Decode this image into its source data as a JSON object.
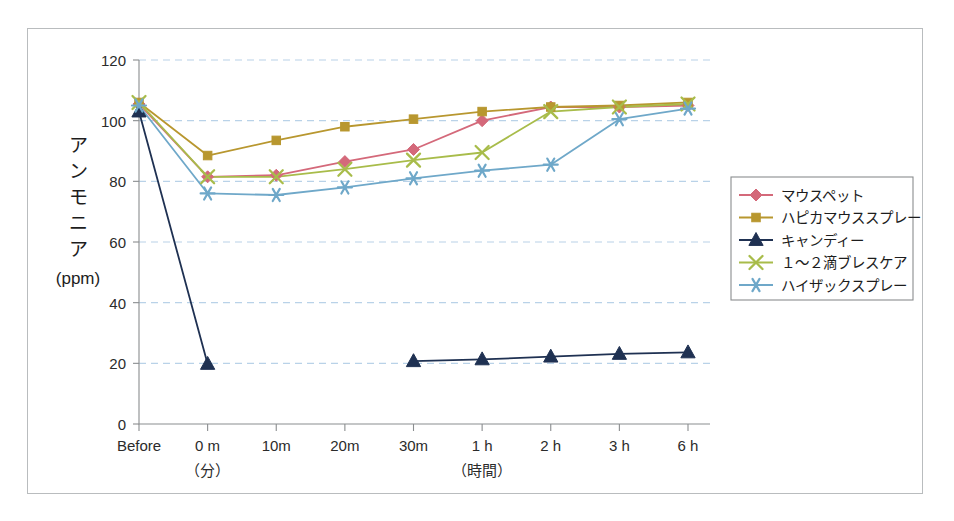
{
  "chart_data": {
    "type": "line",
    "title": "",
    "xlabel": "",
    "ylabel": "アンモニア（ppm）",
    "ylabel_vertical_chars": [
      "ア",
      "ン",
      "モ",
      "ニ",
      "ア"
    ],
    "ylabel_unit": "(ppm)",
    "categories": [
      "Before",
      "0 m",
      "10m",
      "20m",
      "30m",
      "1 h",
      "2 h",
      "3 h",
      "6 h"
    ],
    "x_group_labels": [
      {
        "text": "（分）",
        "after_category": "0 m"
      },
      {
        "text": "（時間）",
        "after_category": "1 h"
      }
    ],
    "ylim": [
      0,
      120
    ],
    "yticks": [
      0,
      20,
      40,
      60,
      80,
      100,
      120
    ],
    "grid": true,
    "grid_axis": "y",
    "legend_position": "right",
    "series": [
      {
        "name": "マウスペット",
        "color": "#d4697a",
        "marker": "diamond",
        "values": [
          105.5,
          81.5,
          82.0,
          86.5,
          90.5,
          100.0,
          104.5,
          104.5,
          105.0
        ]
      },
      {
        "name": "ハピカマウススプレー",
        "color": "#b8972f",
        "marker": "square",
        "values": [
          106.0,
          88.5,
          93.5,
          98.0,
          100.5,
          103.0,
          104.5,
          105.0,
          106.0
        ]
      },
      {
        "name": "キャンディー",
        "color": "#1f3152",
        "marker": "triangle",
        "values": [
          103.0,
          19.8,
          null,
          null,
          20.7,
          21.3,
          22.2,
          23.1,
          23.6
        ]
      },
      {
        "name": "１〜２滴ブレスケア",
        "color": "#a8bc4a",
        "marker": "cross",
        "values": [
          106.0,
          81.5,
          81.5,
          84.0,
          87.0,
          89.5,
          103.0,
          104.5,
          105.5
        ]
      },
      {
        "name": "ハイザックスプレー",
        "color": "#6fa8c9",
        "marker": "asterisk",
        "values": [
          105.0,
          76.0,
          75.5,
          78.0,
          81.0,
          83.5,
          85.5,
          100.5,
          104.0
        ]
      }
    ]
  }
}
